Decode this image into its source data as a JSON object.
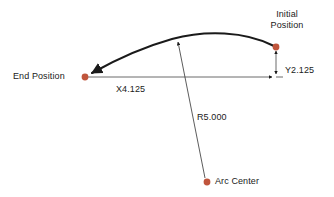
{
  "diagram": {
    "background_color": "#ffffff",
    "line_color": "#1a1a1a",
    "point_color": "#c0553c",
    "labels": {
      "initial_position_line1": "Initial",
      "initial_position_line2": "Position",
      "end_position": "End Position",
      "y_dimension": "Y2.125",
      "x_dimension": "X4.125",
      "radius": "R5.000",
      "arc_center": "Arc Center"
    },
    "values": {
      "x_distance": "4.125",
      "y_distance": "2.125",
      "radius": "5.000"
    },
    "points": [
      {
        "name": "initial-position-point",
        "x": 276,
        "y": 47
      },
      {
        "name": "end-position-point",
        "x": 85,
        "y": 77
      },
      {
        "name": "arc-center-point",
        "x": 207,
        "y": 182
      }
    ]
  }
}
